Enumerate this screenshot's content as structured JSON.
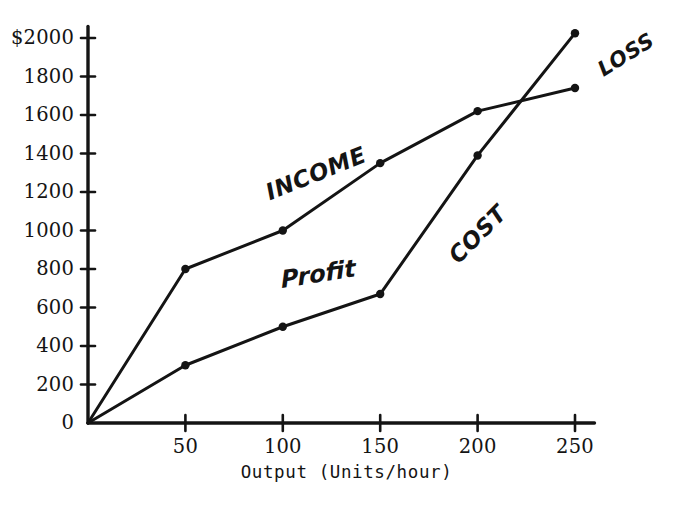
{
  "chart_data": {
    "type": "line",
    "title": "",
    "subtitle": "",
    "xlabel": "Output  (Units/hour)",
    "ylabel": "",
    "xlim": [
      0,
      260
    ],
    "ylim": [
      0,
      2060
    ],
    "grid": false,
    "legend": "inline-annotations",
    "x": [
      0,
      50,
      100,
      150,
      200,
      250
    ],
    "xticks": [
      {
        "value": 50,
        "label": "50"
      },
      {
        "value": 100,
        "label": "100"
      },
      {
        "value": 150,
        "label": "150"
      },
      {
        "value": 200,
        "label": "200"
      },
      {
        "value": 250,
        "label": "250"
      }
    ],
    "yticks": [
      {
        "value": 0,
        "label": "0"
      },
      {
        "value": 200,
        "label": "200"
      },
      {
        "value": 400,
        "label": "400"
      },
      {
        "value": 600,
        "label": "600"
      },
      {
        "value": 800,
        "label": "800"
      },
      {
        "value": 1000,
        "label": "1000"
      },
      {
        "value": 1200,
        "label": "1200"
      },
      {
        "value": 1400,
        "label": "1400"
      },
      {
        "value": 1600,
        "label": "1600"
      },
      {
        "value": 1800,
        "label": "1800"
      },
      {
        "value": 2000,
        "label": "$2000"
      }
    ],
    "series": [
      {
        "name": "INCOME",
        "values": [
          0,
          800,
          1000,
          1350,
          1620,
          1740
        ],
        "stroke_width": 3.0,
        "marker_radius": 4.2
      },
      {
        "name": "COST",
        "values": [
          0,
          300,
          500,
          670,
          1390,
          2025
        ],
        "stroke_width": 3.0,
        "marker_radius": 4.2
      }
    ],
    "annotations": [
      {
        "id": "income",
        "text": "INCOME"
      },
      {
        "id": "cost",
        "text": "COST"
      },
      {
        "id": "loss",
        "text": "LOSS"
      },
      {
        "id": "profit",
        "text": "Profit"
      }
    ],
    "colors": {
      "ink": "#141414",
      "background": "#ffffff"
    }
  }
}
